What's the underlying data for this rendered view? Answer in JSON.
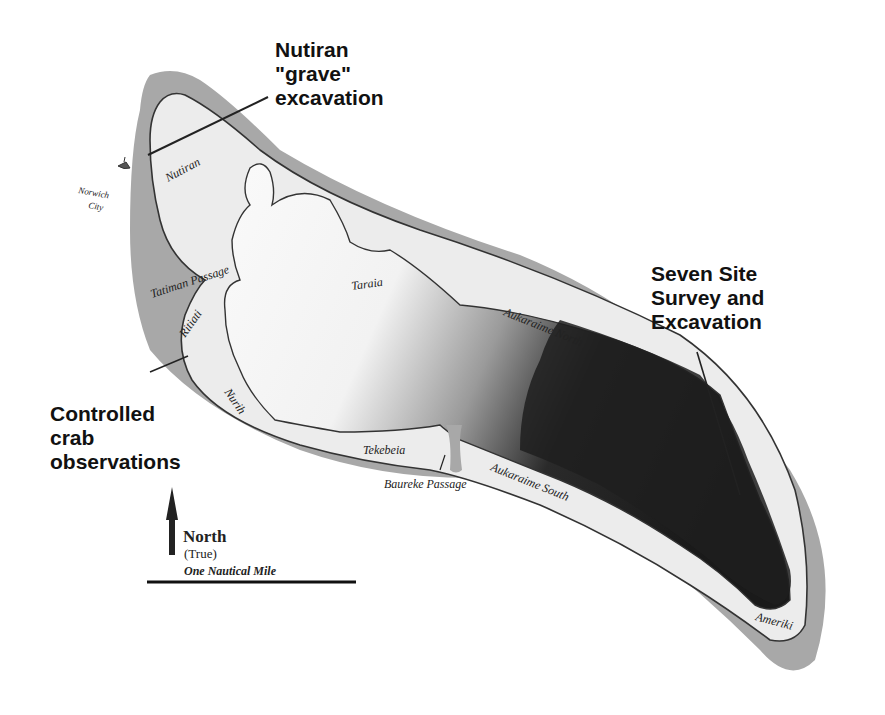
{
  "map": {
    "title": "Atoll site map",
    "colors": {
      "reef": "#a6a6a6",
      "land": "#ececec",
      "lagoon_light": "#fafafa",
      "lagoon_dark": "#1c1c1c",
      "outline": "#333333"
    },
    "callouts": {
      "nutiran": "Nutiran\n\"grave\"\nexcavation",
      "crab": "Controlled\ncrab\nobservations",
      "seven_site": "Seven Site\nSurvey and\nExcavation"
    },
    "places": {
      "nutiran": "Nutiran",
      "norwich_city_1": "Norwich",
      "norwich_city_2": "City",
      "tatiman_passage": "Tatiman Passage",
      "ritiati": "Ritiati",
      "taraia": "Taraia",
      "nurih": "Nurih",
      "tekebeia": "Tekebeia",
      "baureke_passage": "Baureke Passage",
      "aukaraime_north": "Aukaraime North",
      "aukaraime_south": "Aukaraime South",
      "ameriki": "Ameriki"
    },
    "north_arrow": {
      "label": "North",
      "sublabel": "(True)"
    },
    "scale_bar": {
      "label": "One Nautical Mile"
    }
  }
}
